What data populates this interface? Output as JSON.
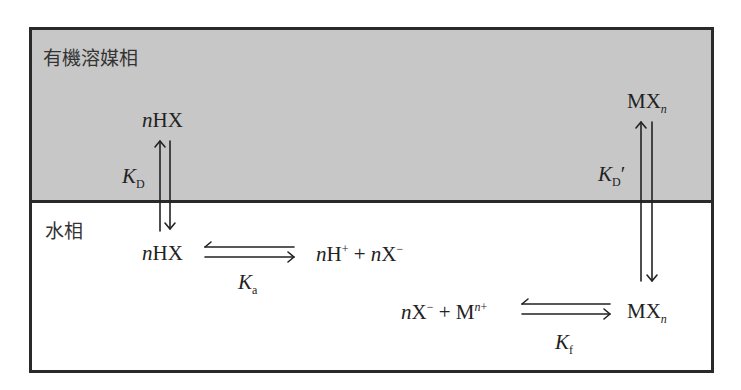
{
  "phases": {
    "organic": {
      "label": "有機溶媒相",
      "color": "#c7c7c7"
    },
    "aqueous": {
      "label": "水相",
      "color": "#ffffff"
    }
  },
  "species": {
    "organic_hx": {
      "coef": "n",
      "formula": "HX"
    },
    "organic_mxn": {
      "formula": "MX",
      "sub": "n"
    },
    "aqueous_hx": {
      "coef": "n",
      "formula": "HX"
    },
    "dissociation_products": {
      "coef1": "n",
      "ion1": "H",
      "charge1": "+",
      "plus": "+",
      "coef2": "n",
      "ion2": "X",
      "charge2": "−"
    },
    "complex_reactants": {
      "coef1": "n",
      "ion1": "X",
      "charge1": "−",
      "plus": "+",
      "ion2": "M",
      "charge2_n": "n",
      "charge2": "+"
    },
    "aqueous_mxn": {
      "formula": "MX",
      "sub": "n"
    }
  },
  "constants": {
    "kd": {
      "symbol": "K",
      "sub": "D"
    },
    "kd_prime": {
      "symbol": "K",
      "sub": "D",
      "prime": "′"
    },
    "ka": {
      "symbol": "K",
      "sub": "a"
    },
    "kf": {
      "symbol": "K",
      "sub": "f"
    }
  }
}
